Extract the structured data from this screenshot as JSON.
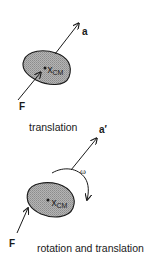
{
  "colors": {
    "ink": "#1a1a1a",
    "body_fill": "#a9a9a9",
    "background": "#ffffff"
  },
  "panel_top": {
    "caption": "translation",
    "force_label": "F",
    "accel_label": "a",
    "com_label_main": "x",
    "com_label_sub": "CM"
  },
  "panel_bottom": {
    "caption": "rotation and translation",
    "force_label": "F",
    "accel_label": "a′",
    "angular_label": "ω",
    "com_label_main": "x",
    "com_label_sub": "CM"
  }
}
